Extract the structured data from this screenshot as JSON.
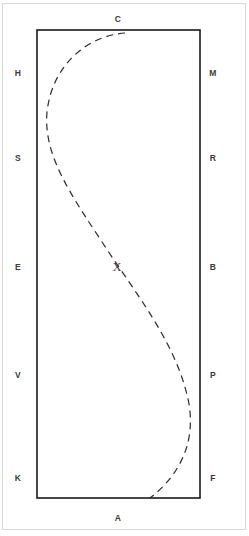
{
  "figure": {
    "type": "diagram",
    "background_color": "#ffffff",
    "page_border_color": "#d9d9d9",
    "rectangle": {
      "name": "boundary-rectangle",
      "stroke_color": "#1a1a1a",
      "stroke_width": 1.6,
      "fill": "none",
      "x": 37,
      "y": 30,
      "width": 163,
      "height": 468
    },
    "curve": {
      "name": "dashed-s-curve",
      "stroke_color": "#2b2b2b",
      "stroke_width": 1.2,
      "dash_pattern": "7 5",
      "style": "dashed",
      "shape": "s-curve",
      "path": "M 125,33 C 86,36 52,66 47,112 C 43,156 72,196 104,245 C 136,294 178,345 189,404 C 196,447 176,478 150,498",
      "start_point": [
        125,
        33
      ],
      "end_point": [
        150,
        498
      ],
      "leftmost_x": 47,
      "rightmost_x": 189
    },
    "center_label": {
      "name": "center-marker",
      "text": "X",
      "x": 117,
      "y": 267,
      "color": "#3a3a3a"
    },
    "labels": {
      "top": [
        {
          "text": "C",
          "x": 118,
          "y": 19
        }
      ],
      "bottom": [
        {
          "text": "A",
          "x": 118,
          "y": 518
        }
      ],
      "left": [
        {
          "text": "H",
          "x": 18,
          "y": 73
        },
        {
          "text": "S",
          "x": 18,
          "y": 158
        },
        {
          "text": "E",
          "x": 18,
          "y": 267
        },
        {
          "text": "V",
          "x": 18,
          "y": 375
        },
        {
          "text": "K",
          "x": 18,
          "y": 478
        }
      ],
      "right": [
        {
          "text": "M",
          "x": 213,
          "y": 73
        },
        {
          "text": "R",
          "x": 213,
          "y": 158
        },
        {
          "text": "B",
          "x": 213,
          "y": 267
        },
        {
          "text": "P",
          "x": 213,
          "y": 375
        },
        {
          "text": "F",
          "x": 213,
          "y": 478
        }
      ]
    }
  }
}
